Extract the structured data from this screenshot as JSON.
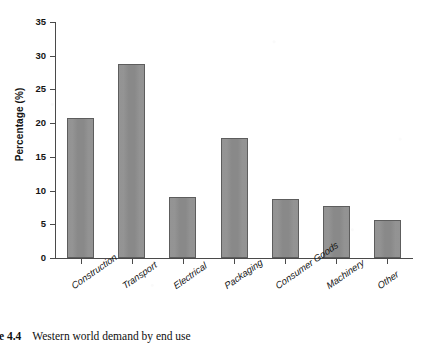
{
  "figure": {
    "caption_number": "re 4.4",
    "caption_text": "Western world demand by end use"
  },
  "colors": {
    "bar_fill": "#8d8d8d",
    "bar_border": "#5d5d5d",
    "axis": "#4a4a4a",
    "text": "#141414",
    "background": "#ffffff"
  },
  "chart_data": {
    "type": "bar",
    "title": "",
    "subtitle": "",
    "xlabel": "",
    "ylabel": "Percentage (%)",
    "categories": [
      "Construction",
      "Transport",
      "Electrical",
      "Packaging",
      "Consumer Goods",
      "Machinery",
      "Other"
    ],
    "values": [
      20.8,
      28.8,
      9.0,
      17.8,
      8.8,
      7.7,
      5.6
    ],
    "ylim": [
      0,
      35
    ],
    "yticks": [
      0,
      5,
      10,
      15,
      20,
      25,
      30,
      35
    ],
    "ytick_labels": [
      "0",
      "5",
      "10",
      "15",
      "20",
      "25",
      "30",
      "35"
    ],
    "grid": false,
    "legend": null,
    "legend_position": "none",
    "annotations": []
  }
}
